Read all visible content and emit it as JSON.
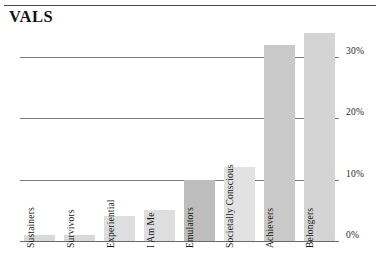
{
  "title": "VALS",
  "chart_data": {
    "type": "bar",
    "title": "VALS",
    "xlabel": "",
    "ylabel": "",
    "ylim": [
      0,
      36
    ],
    "grid": true,
    "legend": "none",
    "orientation": "vertical",
    "categories": [
      "Sustainers",
      "Survivors",
      "Experiential",
      "I Am Me",
      "Emulators",
      "Societally Conscious",
      "Achievers",
      "Belongers"
    ],
    "values": [
      1,
      1,
      4,
      5,
      10,
      12,
      32,
      34
    ],
    "value_suffix": "%",
    "yticks": [
      0,
      10,
      20,
      30
    ],
    "ytick_labels": [
      "0%",
      "10%",
      "20%",
      "30%"
    ],
    "bar_colors": [
      "#d9d9d9",
      "#d9d9d9",
      "#dedede",
      "#dedede",
      "#bdbdbd",
      "#e2e2e2",
      "#c9c9c9",
      "#d4d4d4"
    ]
  },
  "axis": {
    "ytick_labels": [
      "30%",
      "20%",
      "10%",
      "0%"
    ]
  }
}
